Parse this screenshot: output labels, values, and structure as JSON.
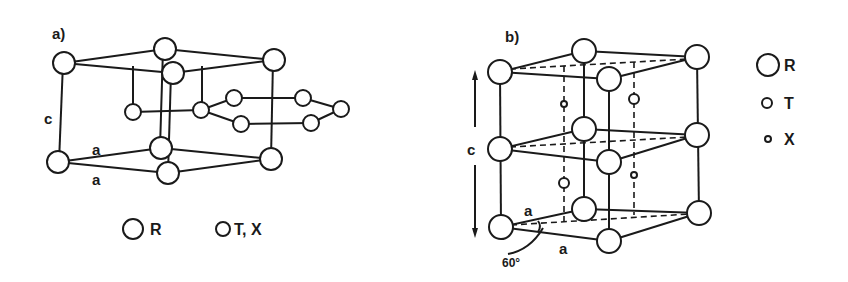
{
  "panels": [
    {
      "id": "a",
      "label": "a)",
      "axis_labels": {
        "c": "c",
        "a1": "a",
        "a2": "a"
      },
      "legend": [
        {
          "symbol": "large-circle",
          "label": "R"
        },
        {
          "symbol": "small-circle",
          "label": "T, X"
        }
      ]
    },
    {
      "id": "b",
      "label": "b)",
      "axis_labels": {
        "c": "c",
        "a1": "a",
        "a2": "a",
        "angle": "60°"
      },
      "legend": [
        {
          "symbol": "large-circle",
          "label": "R"
        },
        {
          "symbol": "medium-circle",
          "label": "T"
        },
        {
          "symbol": "small-circle",
          "label": "X"
        }
      ]
    }
  ],
  "colors": {
    "ink": "#1a1a1a",
    "background": "#ffffff"
  }
}
